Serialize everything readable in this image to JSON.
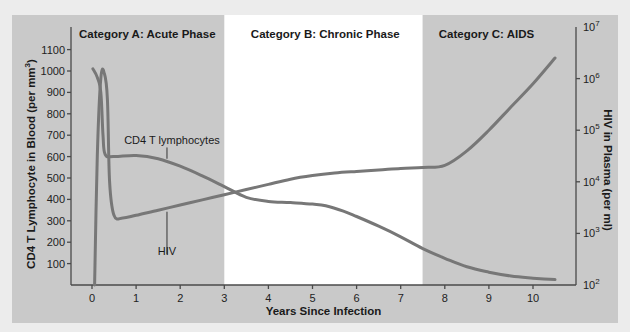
{
  "chart_data": {
    "type": "line",
    "title": "",
    "xlabel": "Years Since Infection",
    "ylabel_left": "CD4 T Lymphocyte in Blood (per mm³)",
    "ylabel_right": "HIV in Plasma (per ml)",
    "xlim": [
      0,
      10.5
    ],
    "ylim_left": [
      0,
      1200
    ],
    "ylim_right_log10": [
      2,
      7
    ],
    "x_ticks": [
      "0",
      "1",
      "2",
      "3",
      "4",
      "5",
      "6",
      "7",
      "8",
      "9",
      "10"
    ],
    "y_ticks_left": [
      "100",
      "200",
      "300",
      "400",
      "500",
      "600",
      "700",
      "800",
      "900",
      "1000",
      "1100"
    ],
    "y_ticks_right": [
      {
        "base": "10",
        "exp": "2"
      },
      {
        "base": "10",
        "exp": "3"
      },
      {
        "base": "10",
        "exp": "4"
      },
      {
        "base": "10",
        "exp": "5"
      },
      {
        "base": "10",
        "exp": "6"
      },
      {
        "base": "10",
        "exp": "7"
      }
    ],
    "regions": [
      {
        "label": "Category A:  Acute Phase",
        "x_start": -0.15,
        "x_end": 3.0,
        "fill": "#c9c9c9"
      },
      {
        "label": "Category B: Chronic Phase",
        "x_start": 3.0,
        "x_end": 7.5,
        "fill": "#ffffff"
      },
      {
        "label": "Category C: AIDS",
        "x_start": 7.5,
        "x_end": 11.3,
        "fill": "#c9c9c9"
      }
    ],
    "grid": false,
    "legend": "inline labels",
    "series": [
      {
        "name": "CD4 T lymphocytes",
        "axis": "left",
        "unit": "per mm³",
        "color": "#777777",
        "points": [
          [
            0.02,
            1010
          ],
          [
            0.12,
            970
          ],
          [
            0.2,
            900
          ],
          [
            0.25,
            700
          ],
          [
            0.3,
            610
          ],
          [
            0.5,
            600
          ],
          [
            1.0,
            605
          ],
          [
            1.5,
            590
          ],
          [
            2.0,
            555
          ],
          [
            2.5,
            510
          ],
          [
            3.0,
            460
          ],
          [
            3.5,
            410
          ],
          [
            4.0,
            390
          ],
          [
            4.5,
            385
          ],
          [
            5.0,
            378
          ],
          [
            5.3,
            370
          ],
          [
            5.7,
            345
          ],
          [
            6.0,
            320
          ],
          [
            6.5,
            275
          ],
          [
            7.0,
            225
          ],
          [
            7.5,
            170
          ],
          [
            8.0,
            125
          ],
          [
            8.5,
            85
          ],
          [
            9.0,
            60
          ],
          [
            9.5,
            42
          ],
          [
            10.0,
            32
          ],
          [
            10.5,
            25
          ]
        ]
      },
      {
        "name": "HIV",
        "axis": "right",
        "unit": "copies per ml (log10)",
        "color": "#777777",
        "points_log10": [
          [
            0.06,
            2.0
          ],
          [
            0.12,
            4.5
          ],
          [
            0.2,
            6.0
          ],
          [
            0.28,
            6.1
          ],
          [
            0.35,
            5.6
          ],
          [
            0.4,
            4.0
          ],
          [
            0.5,
            3.35
          ],
          [
            0.7,
            3.3
          ],
          [
            1.0,
            3.35
          ],
          [
            1.5,
            3.45
          ],
          [
            2.0,
            3.55
          ],
          [
            2.5,
            3.65
          ],
          [
            3.0,
            3.75
          ],
          [
            3.5,
            3.85
          ],
          [
            4.0,
            3.95
          ],
          [
            4.5,
            4.05
          ],
          [
            5.0,
            4.12
          ],
          [
            5.5,
            4.17
          ],
          [
            6.0,
            4.2
          ],
          [
            6.5,
            4.23
          ],
          [
            7.0,
            4.26
          ],
          [
            7.5,
            4.28
          ],
          [
            8.0,
            4.32
          ],
          [
            8.5,
            4.6
          ],
          [
            9.0,
            5.0
          ],
          [
            9.5,
            5.45
          ],
          [
            10.0,
            5.9
          ],
          [
            10.5,
            6.4
          ]
        ]
      }
    ],
    "annotations": [
      {
        "text": "CD4 T lymphocytes",
        "x": 1.7,
        "y_left": 610
      },
      {
        "text": "HIV",
        "x": 1.7,
        "y_left": 200
      }
    ]
  }
}
